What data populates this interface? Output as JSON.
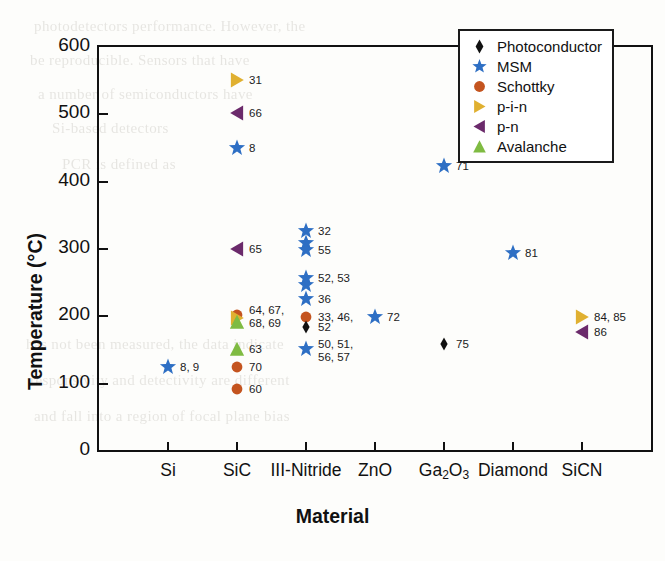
{
  "chart_data": {
    "type": "scatter",
    "title": "",
    "xlabel": "Material",
    "ylabel": "Temperature (°C)",
    "ylim": [
      0,
      600
    ],
    "yticks": [
      0,
      100,
      200,
      300,
      400,
      500,
      600
    ],
    "categories": [
      "Si",
      "SiC",
      "III-Nitride",
      "ZnO",
      "Ga₂O₃",
      "Diamond",
      "SiCN"
    ],
    "grid": false,
    "legend_position": "top-right",
    "legend": [
      {
        "name": "Photoconductor",
        "marker": "diamond",
        "color": "#111111"
      },
      {
        "name": "MSM",
        "marker": "star",
        "color": "#2e6fc4"
      },
      {
        "name": "Schottky",
        "marker": "circle",
        "color": "#c4541f"
      },
      {
        "name": "p-i-n",
        "marker": "triangle-right",
        "color": "#e0b030"
      },
      {
        "name": "p-n",
        "marker": "triangle-left",
        "color": "#6b2a6b"
      },
      {
        "name": "Avalanche",
        "marker": "triangle-up",
        "color": "#7fbb42"
      }
    ],
    "points": [
      {
        "material": "Si",
        "temperature": 123,
        "series": "MSM",
        "label": "8, 9"
      },
      {
        "material": "SiC",
        "temperature": 550,
        "series": "p-i-n",
        "label": "31"
      },
      {
        "material": "SiC",
        "temperature": 500,
        "series": "p-n",
        "label": "66"
      },
      {
        "material": "SiC",
        "temperature": 448,
        "series": "MSM",
        "label": "8"
      },
      {
        "material": "SiC",
        "temperature": 298,
        "series": "p-n",
        "label": "65"
      },
      {
        "material": "SiC",
        "temperature": 200,
        "series": "Schottky",
        "label": "64, 67,\n68, 69"
      },
      {
        "material": "SiC",
        "temperature": 196,
        "series": "p-i-n",
        "label": ""
      },
      {
        "material": "SiC",
        "temperature": 190,
        "series": "Avalanche",
        "label": ""
      },
      {
        "material": "SiC",
        "temperature": 150,
        "series": "Avalanche",
        "label": "63"
      },
      {
        "material": "SiC",
        "temperature": 123,
        "series": "Schottky",
        "label": "70"
      },
      {
        "material": "SiC",
        "temperature": 90,
        "series": "Schottky",
        "label": "60"
      },
      {
        "material": "III-Nitride",
        "temperature": 325,
        "series": "MSM",
        "label": "32"
      },
      {
        "material": "III-Nitride",
        "temperature": 308,
        "series": "MSM",
        "label": ""
      },
      {
        "material": "III-Nitride",
        "temperature": 297,
        "series": "MSM",
        "label": "55"
      },
      {
        "material": "III-Nitride",
        "temperature": 255,
        "series": "MSM",
        "label": "52, 53"
      },
      {
        "material": "III-Nitride",
        "temperature": 245,
        "series": "MSM",
        "label": ""
      },
      {
        "material": "III-Nitride",
        "temperature": 224,
        "series": "MSM",
        "label": "36"
      },
      {
        "material": "III-Nitride",
        "temperature": 198,
        "series": "Schottky",
        "label": "33, 46,"
      },
      {
        "material": "III-Nitride",
        "temperature": 183,
        "series": "Photoconductor",
        "label": "52"
      },
      {
        "material": "III-Nitride",
        "temperature": 150,
        "series": "MSM",
        "label": "50, 51,\n56, 57"
      },
      {
        "material": "ZnO",
        "temperature": 197,
        "series": "MSM",
        "label": "72"
      },
      {
        "material": "Ga₂O₃",
        "temperature": 422,
        "series": "MSM",
        "label": "71"
      },
      {
        "material": "Ga₂O₃",
        "temperature": 157,
        "series": "Photoconductor",
        "label": "75"
      },
      {
        "material": "Diamond",
        "temperature": 293,
        "series": "MSM",
        "label": "81"
      },
      {
        "material": "SiCN",
        "temperature": 197,
        "series": "p-i-n",
        "label": "84, 85"
      },
      {
        "material": "SiCN",
        "temperature": 175,
        "series": "p-n",
        "label": "86"
      }
    ]
  },
  "background_text": [
    "photodetectors  performance.  However,  the",
    "be  reproducible.  Sensors  that  have",
    "a  number  of  semiconductors  have",
    "Si-based  detectors",
    "PCR  is  defined  as",
    "has  not  been  measured,  the  data  indicate",
    "responsivity  and  detectivity  are  different",
    "and  fall  into  a  region  of  focal  plane  bias"
  ]
}
